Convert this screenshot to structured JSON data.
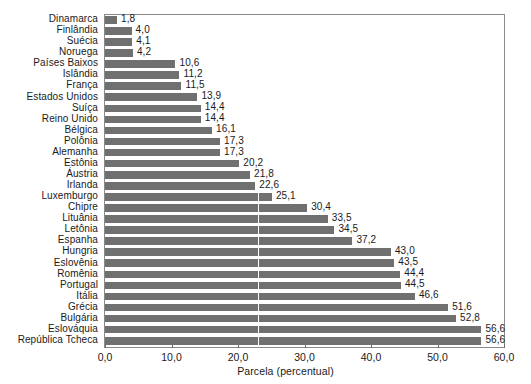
{
  "chart_data": {
    "type": "bar",
    "orientation": "horizontal",
    "title": "",
    "subtitle": "",
    "xlabel": "Parcela (percentual)",
    "ylabel": "",
    "xlim": [
      0.0,
      60.0
    ],
    "xticks": [
      "0,0",
      "10,0",
      "20,0",
      "30,0",
      "40,0",
      "50,0",
      "60,0"
    ],
    "xtick_values": [
      0,
      10,
      20,
      30,
      40,
      50,
      60
    ],
    "grid": "single vertical white gridline inside bars near 23,0",
    "gridline_values": [
      23.0
    ],
    "legend": "none",
    "bar_color": "#707070",
    "decimal_separator": ",",
    "categories": [
      "Dinamarca",
      "Finlândia",
      "Suécia",
      "Noruega",
      "Países Baixos",
      "Islândia",
      "França",
      "Estados Unidos",
      "Suíça",
      "Reino Unido",
      "Bélgica",
      "Polônia",
      "Alemanha",
      "Estônia",
      "Áustria",
      "Irlanda",
      "Luxemburgo",
      "Chipre",
      "Lituânia",
      "Letônia",
      "Espanha",
      "Hungria",
      "Eslovênia",
      "Romênia",
      "Portugal",
      "Itália",
      "Grécia",
      "Bulgária",
      "Eslováquia",
      "República Tcheca"
    ],
    "values": [
      1.8,
      4.0,
      4.1,
      4.2,
      10.6,
      11.2,
      11.5,
      13.9,
      14.4,
      14.4,
      16.1,
      17.3,
      17.3,
      20.2,
      21.8,
      22.6,
      25.1,
      30.4,
      33.5,
      34.5,
      37.2,
      43.0,
      43.5,
      44.4,
      44.5,
      46.6,
      51.6,
      52.8,
      56.6,
      56.6
    ],
    "value_labels": [
      "1,8",
      "4,0",
      "4,1",
      "4,2",
      "10,6",
      "11,2",
      "11,5",
      "13,9",
      "14,4",
      "14,4",
      "16,1",
      "17,3",
      "17,3",
      "20,2",
      "21,8",
      "22,6",
      "25,1",
      "30,4",
      "33,5",
      "34,5",
      "37,2",
      "43,0",
      "43,5",
      "44,4",
      "44,5",
      "46,6",
      "51,6",
      "52,8",
      "56,6",
      "56,6"
    ]
  }
}
